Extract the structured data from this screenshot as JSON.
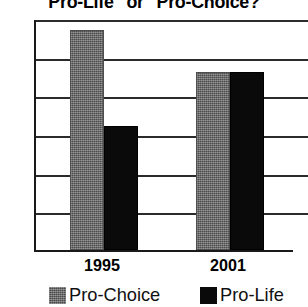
{
  "chart_data": {
    "type": "bar",
    "title": "\"Pro-Life\" or \"Pro-Choice?\"",
    "xlabel": "",
    "ylabel": "",
    "categories": [
      "1995",
      "2001"
    ],
    "series": [
      {
        "name": "Pro-Choice",
        "color": "#6b6b6b",
        "values": [
          57,
          46
        ]
      },
      {
        "name": "Pro-Life",
        "color": "#0a0a0a",
        "values": [
          32,
          46
        ]
      }
    ],
    "ylim": [
      0,
      60
    ],
    "ytick_labels": [
      "0%",
      "10%",
      "20%",
      "30%",
      "40%",
      "50%",
      "60%"
    ],
    "ytick_values": [
      0,
      10,
      20,
      30,
      40,
      50,
      60
    ],
    "grid": true,
    "legend_position": "bottom",
    "value_suffix": "%"
  },
  "legend": {
    "items": [
      {
        "label": "Pro-Choice",
        "swatch": "gray-swatch"
      },
      {
        "label": "Pro-Life",
        "swatch": "black-swatch"
      }
    ]
  }
}
